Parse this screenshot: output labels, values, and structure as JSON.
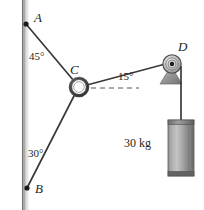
{
  "figure": {
    "type": "statics-free-body-diagram",
    "background_color": "#ffffff",
    "line_color": "#333333",
    "wall": {
      "name": "vertical-wall",
      "x": 22,
      "y_top": 0,
      "y_bottom": 210,
      "width": 6,
      "color_light": "#f2f2f2",
      "color_dark": "#8a8a8a"
    },
    "points": {
      "A": {
        "label": "A",
        "x": 26,
        "y": 24
      },
      "B": {
        "label": "B",
        "x": 27,
        "y": 188
      },
      "C": {
        "label": "C",
        "x": 79,
        "y": 86
      },
      "D": {
        "label": "D",
        "x": 173,
        "y": 64
      }
    },
    "angles": {
      "at_A": "45°",
      "at_B": "30°",
      "at_C": "15°"
    },
    "ring": {
      "name": "collar-ring-at-C",
      "outer_radius": 9,
      "inner_radius": 5.5,
      "color": "#4d4d4d"
    },
    "pulley": {
      "name": "pulley-at-D",
      "radius": 9,
      "hub_radius": 2.2,
      "bracket_color": "#9c9c9c"
    },
    "weight": {
      "label": "30 kg",
      "x": 168,
      "y": 120,
      "width": 25,
      "height": 55,
      "color_light": "#bdbdbd",
      "color_dark": "#6e6e6e"
    },
    "dashed_reference": {
      "name": "horizontal-reference-line",
      "from_x": 92,
      "to_x": 139,
      "y": 88
    }
  }
}
